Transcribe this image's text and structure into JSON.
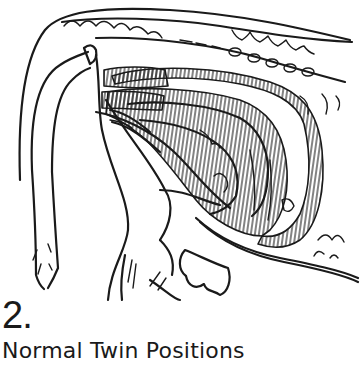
{
  "figure": {
    "number": "2.",
    "caption": "Normal Twin Positions",
    "colors": {
      "ink": "#1a1a1a",
      "background": "#ffffff"
    }
  }
}
